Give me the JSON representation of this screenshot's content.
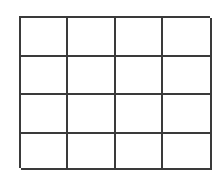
{
  "grid": {
    "rows": 4,
    "columns": 4,
    "line_color": "#3a3a3a",
    "background": "#ffffff",
    "cells": [
      [
        "",
        "",
        "",
        ""
      ],
      [
        "",
        "",
        "",
        ""
      ],
      [
        "",
        "",
        "",
        ""
      ],
      [
        "",
        "",
        "",
        ""
      ]
    ]
  }
}
